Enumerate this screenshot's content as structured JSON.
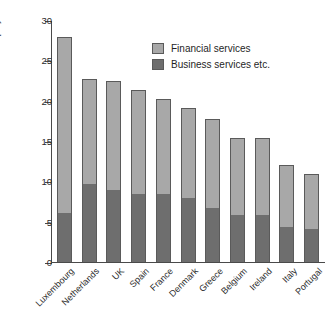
{
  "chart_data": {
    "type": "bar",
    "subtype": "stacked-vertical",
    "title": "",
    "xlabel": "",
    "ylabel": "% of total employment",
    "ylim": [
      0,
      30
    ],
    "yticks": [
      0,
      5,
      10,
      15,
      20,
      25,
      30
    ],
    "ytick_labels": [
      "0",
      "5",
      "10",
      "15",
      "20",
      "25",
      "30"
    ],
    "grid": false,
    "legend_position": "upper-right-inside",
    "categories": [
      "Luxembourg",
      "Netherlands",
      "UK",
      "Spain",
      "France",
      "Denmark",
      "Greece",
      "Belgium",
      "Ireland",
      "Italy",
      "Portugal"
    ],
    "series": [
      {
        "name": "Business services etc.",
        "color": "#6e6e6e",
        "values": [
          6.2,
          9.8,
          9.1,
          8.6,
          8.5,
          8.0,
          6.8,
          5.9,
          6.0,
          4.5,
          4.2
        ]
      },
      {
        "name": "Financial services",
        "color": "#a8a8a8",
        "values": [
          21.8,
          13.0,
          13.5,
          12.9,
          11.8,
          11.2,
          11.1,
          9.6,
          9.5,
          7.7,
          6.8
        ]
      }
    ],
    "totals": [
      28.0,
      22.8,
      22.6,
      21.5,
      20.3,
      19.2,
      17.9,
      15.5,
      15.5,
      12.2,
      11.0
    ]
  },
  "legend": {
    "items": [
      {
        "label": "Financial services",
        "color": "#a8a8a8"
      },
      {
        "label": "Business services etc.",
        "color": "#6e6e6e"
      }
    ]
  },
  "colors": {
    "financial_services": "#a8a8a8",
    "business_services": "#6e6e6e",
    "axis": "#4a4a4a",
    "bar_outline": "#5a5a5a",
    "background": "#ffffff"
  }
}
